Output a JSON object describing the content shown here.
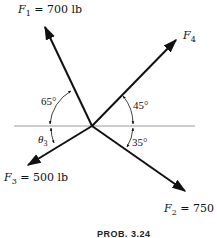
{
  "diagram": {
    "caption": "PROB. 3.24",
    "forces": [
      {
        "id": "F1",
        "symbol": "F",
        "subscript": "1",
        "label_suffix": " = 700 lb",
        "magnitude": "700 lb",
        "direction": "up-left, 65° from horizontal"
      },
      {
        "id": "F2",
        "symbol": "F",
        "subscript": "2",
        "label_suffix": " = 750 lb",
        "magnitude": "750 lb",
        "direction": "down-right, 35° below horizontal"
      },
      {
        "id": "F3",
        "symbol": "F",
        "subscript": "3",
        "label_suffix": " = 500 lb",
        "magnitude": "500 lb",
        "direction": "down-left, θ3 below horizontal"
      },
      {
        "id": "F4",
        "symbol": "F",
        "subscript": "4",
        "label_suffix": "",
        "magnitude": "",
        "direction": "up-right, 45° above horizontal"
      }
    ],
    "angles": {
      "a65": "65°",
      "a45": "45°",
      "a35": "35°",
      "theta3_symbol": "θ",
      "theta3_sub": "3"
    },
    "colors": {
      "stroke": "#111111",
      "axis": "#999999",
      "background": "#ffffff"
    }
  }
}
